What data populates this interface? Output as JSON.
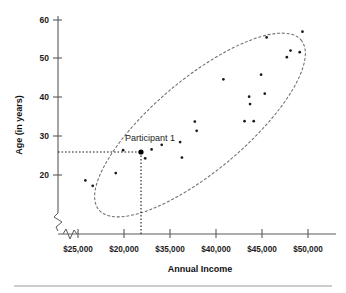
{
  "chart_data": {
    "type": "scatter",
    "title": "",
    "xlabel": "Annual Income",
    "ylabel": "Age (in years)",
    "x_tick_labels": [
      "$25,000",
      "$20,000",
      "$35,000",
      "$40,000",
      "$45,000",
      "$50,000"
    ],
    "x_tick_values": [
      25000,
      20000,
      35000,
      40000,
      45000,
      50000
    ],
    "y_tick_labels": [
      "20",
      "30",
      "40",
      "50",
      "60"
    ],
    "y_tick_values": [
      20,
      30,
      40,
      50,
      60
    ],
    "ylim": [
      14,
      61
    ],
    "xlim": [
      22500,
      52500
    ],
    "grid": false,
    "legend": null,
    "axis_break_x": true,
    "axis_break_y": true,
    "annotations": [
      {
        "label": "Participant 1",
        "point_income": 32000,
        "point_age": 28.8,
        "guide_lines": [
          "horizontal-to-y-axis",
          "vertical-to-x-axis"
        ]
      }
    ],
    "highlight_point": {
      "income": 32000,
      "age": 28.8
    },
    "cluster_outline": {
      "shape": "ellipse",
      "description": "dashed ellipse enclosing all points, tilted positively"
    },
    "points": [
      {
        "income": 25800,
        "age": 18.6
      },
      {
        "income": 26600,
        "age": 17.2
      },
      {
        "income": 29100,
        "age": 20.5
      },
      {
        "income": 29900,
        "age": 26.4
      },
      {
        "income": 32000,
        "age": 28.8
      },
      {
        "income": 32300,
        "age": 24.3
      },
      {
        "income": 33000,
        "age": 26.6
      },
      {
        "income": 34100,
        "age": 27.8
      },
      {
        "income": 36100,
        "age": 28.5
      },
      {
        "income": 36300,
        "age": 24.5
      },
      {
        "income": 37700,
        "age": 33.8
      },
      {
        "income": 37900,
        "age": 31.4
      },
      {
        "income": 40800,
        "age": 44.7
      },
      {
        "income": 43100,
        "age": 33.9
      },
      {
        "income": 43600,
        "age": 40.2
      },
      {
        "income": 43700,
        "age": 38.3
      },
      {
        "income": 44100,
        "age": 33.9
      },
      {
        "income": 44900,
        "age": 45.9
      },
      {
        "income": 45300,
        "age": 41.0
      },
      {
        "income": 45500,
        "age": 55.5
      },
      {
        "income": 47700,
        "age": 50.4
      },
      {
        "income": 48100,
        "age": 52.1
      },
      {
        "income": 49100,
        "age": 51.7
      },
      {
        "income": 49400,
        "age": 57.0
      }
    ]
  },
  "labels": {
    "y_axis_title": "Age (in years)",
    "x_axis_title": "Annual Income",
    "annotation_participant": "Participant 1",
    "x_ticks": [
      "$25,000",
      "$20,000",
      "$35,000",
      "$40,000",
      "$45,000",
      "$50,000"
    ],
    "y_ticks": [
      "20",
      "30",
      "40",
      "50",
      "60"
    ]
  },
  "colors": {
    "point": "#1a1a1a",
    "axis": "#5a5a5a",
    "ellipse": "#6e6e6e",
    "guide": "#1a1a1a",
    "background": "#ffffff",
    "footer_rule": "#9a9a9a"
  }
}
